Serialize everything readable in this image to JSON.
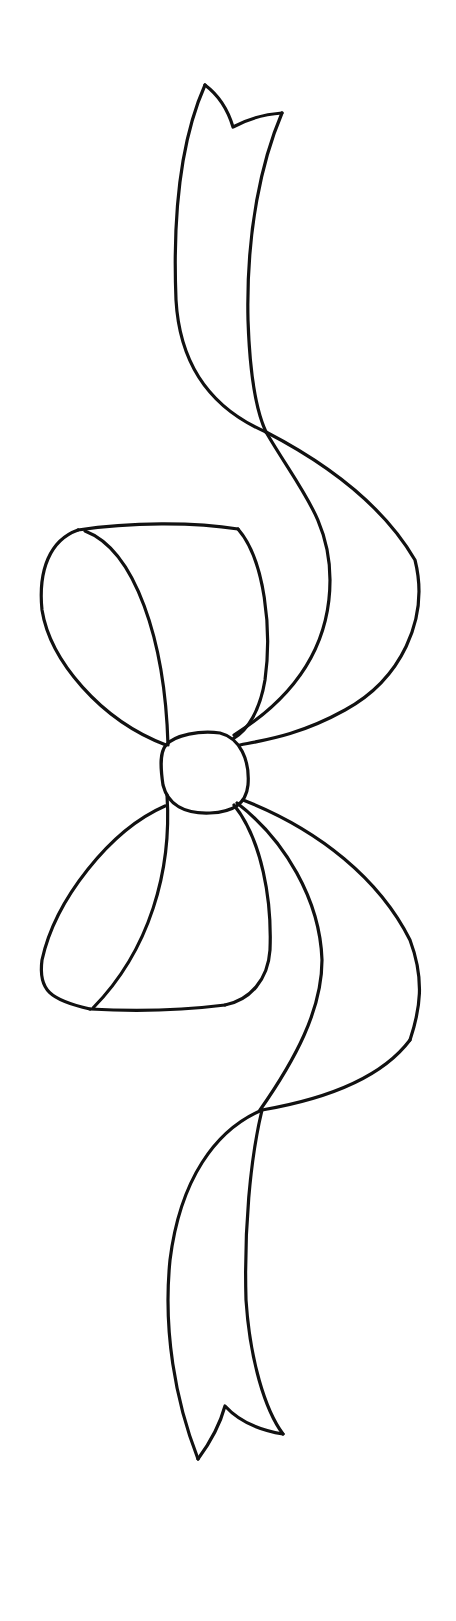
{
  "image": {
    "subject": "bow-with-ribbon-line-art",
    "background_color": "#ffffff",
    "line_color": "#111111",
    "width": 456,
    "height": 1621
  },
  "parts": [
    {
      "name": "upper-ribbon-tail",
      "description": "ribbon tail rising to a notched (forked) end at top"
    },
    {
      "name": "upper-left-loop",
      "description": "left bow loop above the knot"
    },
    {
      "name": "upper-right-streamers",
      "description": "ribbon bands sweeping up-right from the knot"
    },
    {
      "name": "center-knot",
      "description": "round knot at the middle"
    },
    {
      "name": "lower-left-loop",
      "description": "left bow loop below the knot"
    },
    {
      "name": "lower-right-streamers",
      "description": "ribbon bands sweeping down-right from the knot"
    },
    {
      "name": "lower-ribbon-tail",
      "description": "ribbon tail falling to a notched (forked) end at bottom"
    }
  ]
}
